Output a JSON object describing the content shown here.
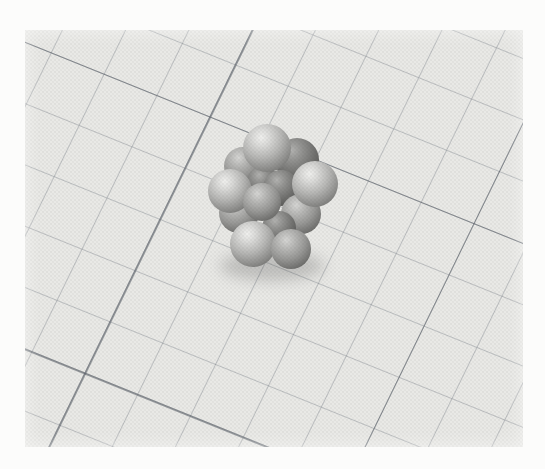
{
  "scene": {
    "description": "Black-and-white halftone photograph of a space-filling molecular model (cluster of gray atom spheres) resting on graph paper rotated diagonally",
    "kind": "photograph"
  },
  "photo": {
    "margin_color": "#fcfcfb",
    "paper_color": "#e9e9e6",
    "frame": {
      "left": 25,
      "top": 30,
      "width": 498,
      "height": 417
    }
  },
  "grid": {
    "cell_size_px": 57,
    "major_every_cells": 5,
    "rotation_deg": 22,
    "skew_x_deg": -4,
    "minor_line_color": "rgba(122,128,136,0.40)",
    "major_line_color": "rgba(90,96,104,0.60)",
    "minor_line_width_px": 1,
    "major_line_width_px": 1.5,
    "offset_x_px": 18,
    "offset_y_px": 40
  },
  "molecule": {
    "center_note": "coordinates are relative to photo frame, cx/cy sphere centers, r radius in px",
    "shadow": {
      "cx": 247,
      "cy": 236,
      "rx": 52,
      "ry": 15,
      "color": "rgba(55,55,55,0.22)"
    },
    "atoms": [
      {
        "cx": 218,
        "cy": 136,
        "r": 19,
        "tone": "medium"
      },
      {
        "cx": 272,
        "cy": 130,
        "r": 22,
        "tone": "dark"
      },
      {
        "cx": 238,
        "cy": 152,
        "r": 16,
        "tone": "dark"
      },
      {
        "cx": 256,
        "cy": 158,
        "r": 18,
        "tone": "dark"
      },
      {
        "cx": 214,
        "cy": 183,
        "r": 20,
        "tone": "medium"
      },
      {
        "cx": 276,
        "cy": 184,
        "r": 20,
        "tone": "medium"
      },
      {
        "cx": 254,
        "cy": 198,
        "r": 17,
        "tone": "dark"
      },
      {
        "cx": 242,
        "cy": 118,
        "r": 24,
        "tone": "light"
      },
      {
        "cx": 205,
        "cy": 161,
        "r": 22,
        "tone": "light"
      },
      {
        "cx": 237,
        "cy": 172,
        "r": 19,
        "tone": "medium"
      },
      {
        "cx": 290,
        "cy": 154,
        "r": 23,
        "tone": "light"
      },
      {
        "cx": 228,
        "cy": 214,
        "r": 23,
        "tone": "light"
      },
      {
        "cx": 266,
        "cy": 219,
        "r": 20,
        "tone": "medium"
      }
    ]
  },
  "tones": {
    "light": [
      [
        "0%",
        "#f0f0ee"
      ],
      [
        "18%",
        "#dbdbd9"
      ],
      [
        "45%",
        "#b6b6b4"
      ],
      [
        "72%",
        "#8a8a88"
      ],
      [
        "100%",
        "#585856"
      ]
    ],
    "medium": [
      [
        "0%",
        "#d6d6d4"
      ],
      [
        "20%",
        "#bcbcba"
      ],
      [
        "50%",
        "#989896"
      ],
      [
        "78%",
        "#6e6e6c"
      ],
      [
        "100%",
        "#4b4b49"
      ]
    ],
    "dark": [
      [
        "0%",
        "#b2b2b0"
      ],
      [
        "25%",
        "#929290"
      ],
      [
        "55%",
        "#71716f"
      ],
      [
        "100%",
        "#454543"
      ]
    ]
  }
}
